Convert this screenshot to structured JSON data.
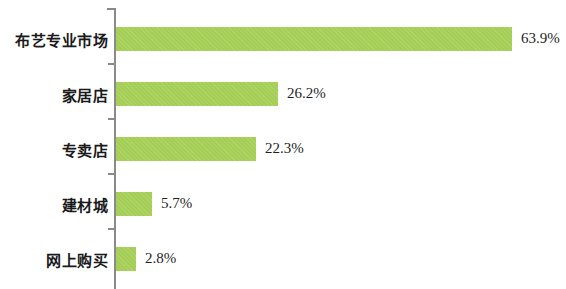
{
  "chart_data": {
    "type": "bar",
    "orientation": "horizontal",
    "title": "",
    "xlabel": "",
    "ylabel": "",
    "grid": false,
    "legend": false,
    "axis_color": "#8a8a8a",
    "bar_color": "#a5ce56",
    "xlim": [
      0,
      63.9
    ],
    "categories": [
      "布艺专业市场",
      "家居店",
      "专卖店",
      "建材城",
      "网上购买"
    ],
    "values": [
      63.9,
      26.2,
      22.3,
      5.7,
      2.8
    ],
    "value_labels": [
      "63.9%",
      "26.2%",
      "22.3%",
      "5.7%",
      "2.8%"
    ],
    "bars": [
      {
        "category": "布艺专业市场",
        "value": 63.9,
        "label": "63.9%",
        "pixel_width": 396
      },
      {
        "category": "家居店",
        "value": 26.2,
        "label": "26.2%",
        "pixel_width": 162
      },
      {
        "category": "专卖店",
        "value": 22.3,
        "label": "22.3%",
        "pixel_width": 140
      },
      {
        "category": "建材城",
        "value": 5.7,
        "label": "5.7%",
        "pixel_width": 36
      },
      {
        "category": "网上购买",
        "value": 2.8,
        "label": "2.8%",
        "pixel_width": 20
      }
    ]
  }
}
